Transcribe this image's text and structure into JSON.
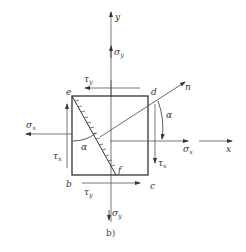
{
  "diagram": {
    "caption": "b)",
    "axes": {
      "x": "x",
      "y": "y",
      "normal": "n"
    },
    "corners": {
      "e": "e",
      "d": "d",
      "b": "b",
      "c": "c",
      "f": "f"
    },
    "angle": "α",
    "angle_inner": "α",
    "stresses": {
      "sigma_x_left": {
        "symbol": "σ",
        "sub": "x"
      },
      "sigma_x_right": {
        "symbol": "σ",
        "sub": "x"
      },
      "sigma_y_top": {
        "symbol": "σ",
        "sub": "y"
      },
      "sigma_y_bottom": {
        "symbol": "σ",
        "sub": "y"
      },
      "tau_x_left": {
        "symbol": "τ",
        "sub": "x"
      },
      "tau_x_right": {
        "symbol": "τ",
        "sub": "x"
      },
      "tau_y_top": {
        "symbol": "τ",
        "sub": "y"
      },
      "tau_y_bottom": {
        "symbol": "τ",
        "sub": "y"
      }
    },
    "colors": {
      "line": "#333333",
      "thin": "#555555"
    }
  }
}
